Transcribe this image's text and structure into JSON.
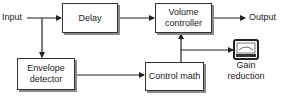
{
  "diagram": {
    "type": "block-diagram",
    "labels": {
      "input": "Input",
      "output": "Output",
      "gain_reduction_line1": "Gain",
      "gain_reduction_line2": "reduction"
    },
    "blocks": {
      "delay": {
        "label": "Delay"
      },
      "volume_controller": {
        "line1": "Volume",
        "line2": "controller"
      },
      "envelope_detector": {
        "line1": "Envelope",
        "line2": "detector"
      },
      "control_math": {
        "label": "Control math"
      }
    },
    "meter": {
      "icon": "gain-meter-icon"
    },
    "connections": [
      {
        "from": "Input",
        "to": "Delay"
      },
      {
        "from": "Input",
        "to": "Envelope detector"
      },
      {
        "from": "Delay",
        "to": "Volume controller"
      },
      {
        "from": "Volume controller",
        "to": "Output"
      },
      {
        "from": "Envelope detector",
        "to": "Control math"
      },
      {
        "from": "Control math",
        "to": "Volume controller"
      },
      {
        "from": "Control math",
        "to": "Gain reduction meter"
      }
    ],
    "colors": {
      "line": "#222222",
      "box_border": "#333333",
      "shadow": "#8a8a8a",
      "background": "#ffffff"
    }
  }
}
